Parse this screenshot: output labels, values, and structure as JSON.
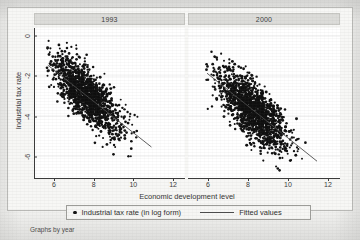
{
  "figure": {
    "footnote": "Graphs by year"
  },
  "legend": {
    "marker_label": "Industrial tax rate (in log form)",
    "line_label": "Fitted values",
    "marker_icon": "filled-circle-marker",
    "line_icon": "fitted-line-swatch"
  },
  "chart_data": {
    "type": "scatter",
    "title": "",
    "xlabel": "Economic development level",
    "ylabel": "Industrial tax rate",
    "xlim": [
      5.0,
      12.6
    ],
    "ylim": [
      -7.1,
      0.4
    ],
    "xticks": [
      6,
      8,
      10,
      12
    ],
    "yticks": [
      0,
      -2,
      -4,
      -6
    ],
    "ytick_labels": [
      "0",
      "-2",
      "-4",
      "-6"
    ],
    "grid": "horizontal-faint",
    "legend_position": "bottom-center-boxed",
    "facet_by": "year",
    "marker_color": "#101010",
    "fit_line_color": "#4a4a4a",
    "panel_title_bg": "#dcdcd9",
    "plot_bg": "#ffffff",
    "figure_bg": "#f1f1ef",
    "panels": [
      {
        "title": "1993",
        "n_points": 1450,
        "x_range": [
          5.6,
          11.0
        ],
        "y_range": [
          -6.3,
          -0.1
        ],
        "x_mean": 7.6,
        "y_mean": -2.95,
        "x_sd": 0.85,
        "y_sd": 0.95,
        "correlation": -0.74,
        "fit": {
          "slope": -0.78,
          "intercept": 2.95,
          "x_start": 5.65,
          "x_end": 10.9
        }
      },
      {
        "title": "2000",
        "n_points": 1500,
        "x_range": [
          5.9,
          11.5
        ],
        "y_range": [
          -6.9,
          -0.6
        ],
        "x_mean": 8.3,
        "y_mean": -3.75,
        "x_sd": 0.88,
        "y_sd": 1.0,
        "correlation": -0.72,
        "fit": {
          "slope": -0.8,
          "intercept": 2.9,
          "x_start": 5.95,
          "x_end": 11.45
        }
      }
    ]
  },
  "axes": {
    "xtitle": "Economic development level",
    "ytitle": "Industrial tax rate"
  }
}
